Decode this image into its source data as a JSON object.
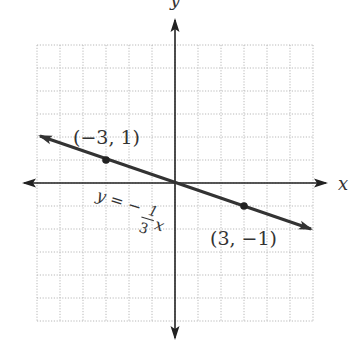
{
  "chart_data": {
    "type": "line",
    "title": "",
    "xlabel": "x",
    "ylabel": "y",
    "xlim": [
      -6,
      6
    ],
    "ylim": [
      -6,
      6
    ],
    "grid": true,
    "grid_style": "dotted",
    "axes_arrows": true,
    "series": [
      {
        "name": "y = -1/3 x",
        "equation": "y = -(1/3)x",
        "slope": -0.3333,
        "intercept": 0,
        "x": [
          -6,
          6
        ],
        "y": [
          2,
          -2
        ],
        "arrows_both_ends": true
      }
    ],
    "points": [
      {
        "x": -3,
        "y": 1,
        "label": "(−3, 1)"
      },
      {
        "x": 3,
        "y": -1,
        "label": "(3, −1)"
      }
    ],
    "annotations": [
      {
        "text": "y = −",
        "fraction_num": "1",
        "fraction_den": "3",
        "var": "x",
        "position": "below line left of origin"
      }
    ]
  },
  "labels": {
    "x_axis": "x",
    "y_axis": "y",
    "point_a": "(−3, 1)",
    "point_b": "(3, −1)",
    "eq_prefix": "y = −",
    "eq_num": "1",
    "eq_den": "3",
    "eq_var": "x"
  },
  "colors": {
    "grid": "#b8b8b8",
    "axis": "#222222",
    "line": "#333333",
    "text": "#333333"
  }
}
